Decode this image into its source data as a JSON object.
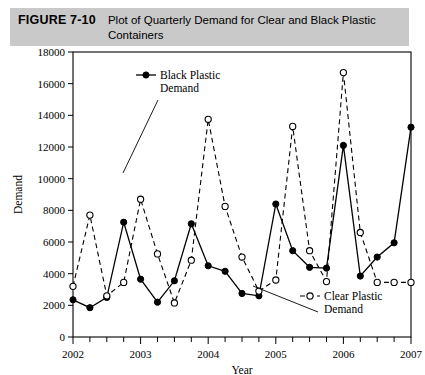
{
  "figure": {
    "label": "FIGURE 7-10",
    "title": "Plot of Quarterly Demand for Clear and Black Plastic Containers",
    "caption_background": "#c9c9c9"
  },
  "chart_data": {
    "type": "line",
    "title": "Plot of Quarterly Demand for Clear and Black Plastic Containers",
    "xlabel": "Year",
    "ylabel": "Demand",
    "xlim": [
      2002,
      2007
    ],
    "ylim": [
      0,
      18000
    ],
    "ytick_interval": 2000,
    "yticks": [
      0,
      2000,
      4000,
      6000,
      8000,
      10000,
      12000,
      14000,
      16000,
      18000
    ],
    "ytick_labels": [
      "0",
      "2000",
      "4000",
      "6000",
      "8000",
      "10000",
      "12000",
      "14000",
      "16000",
      "18000"
    ],
    "xticks": [
      2002,
      2003,
      2004,
      2005,
      2006,
      2007
    ],
    "xtick_labels": [
      "2002",
      "2003",
      "2004",
      "2005",
      "2006",
      "2007"
    ],
    "minor_xticks_per_year": 4,
    "grid": false,
    "legend_position": "inside",
    "x": [
      2002.0,
      2002.25,
      2002.5,
      2002.75,
      2003.0,
      2003.25,
      2003.5,
      2003.75,
      2004.0,
      2004.25,
      2004.5,
      2004.75,
      2005.0,
      2005.25,
      2005.5,
      2005.75,
      2006.0,
      2006.25,
      2006.5,
      2006.75,
      2007.0
    ],
    "series": [
      {
        "name": "Black Plastic Demand",
        "marker": "filled-circle",
        "line": "solid",
        "color": "#000000",
        "values": [
          2350,
          1850,
          2500,
          7250,
          3650,
          2200,
          3550,
          7150,
          4500,
          4150,
          2750,
          2600,
          8400,
          5450,
          4400,
          4350,
          12100,
          3850,
          5050,
          5950,
          13250
        ]
      },
      {
        "name": "Clear Plastic Demand",
        "marker": "open-circle",
        "line": "dashed",
        "color": "#000000",
        "values": [
          3200,
          7700,
          2600,
          3450,
          8700,
          5250,
          2150,
          4850,
          13750,
          8250,
          5050,
          2900,
          3600,
          13300,
          5450,
          3500,
          16700,
          6600,
          3450,
          3450,
          3450
        ]
      }
    ],
    "note": "21 quarterly observations from 2002 Q1 through 2007 Q1"
  },
  "legend": {
    "black": {
      "label_line1": "Black Plastic",
      "label_line2": "Demand"
    },
    "clear": {
      "label_line1": "Clear Plastic",
      "label_line2": "Demand"
    }
  }
}
